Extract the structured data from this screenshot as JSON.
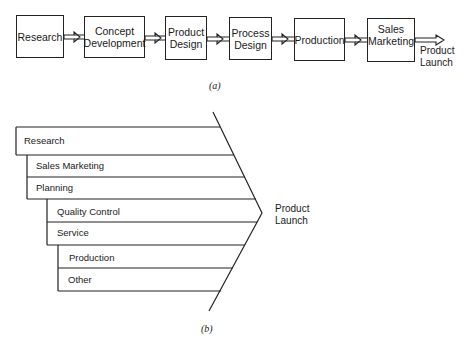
{
  "diagram_a": {
    "caption": "(a)",
    "steps": [
      {
        "line1": "Research",
        "line2": ""
      },
      {
        "line1": "Concept",
        "line2": "Development"
      },
      {
        "line1": "Product",
        "line2": "Design"
      },
      {
        "line1": "Process",
        "line2": "Design"
      },
      {
        "line1": "Production",
        "line2": ""
      },
      {
        "line1": "Sales",
        "line2": "Marketing"
      }
    ],
    "outcome": {
      "line1": "Product",
      "line2": "Launch"
    }
  },
  "diagram_b": {
    "caption": "(b)",
    "bars": [
      {
        "label": "Research"
      },
      {
        "label": "Sales Marketing"
      },
      {
        "label": "Planning"
      },
      {
        "label": "Quality Control"
      },
      {
        "label": "Service"
      },
      {
        "label": "Production"
      },
      {
        "label": "Other"
      }
    ],
    "outcome": {
      "line1": "Product",
      "line2": "Launch"
    }
  }
}
